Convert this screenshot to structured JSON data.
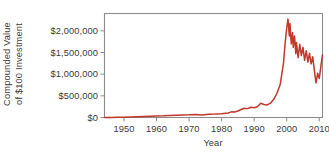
{
  "chart_data": {
    "type": "line",
    "title": "",
    "xlabel": "Year",
    "ylabel_lines": [
      "Compounded Value",
      "of $100 Investment"
    ],
    "ylabel": "Compounded Value of $100 Investment",
    "xlim": [
      1944,
      2011
    ],
    "ylim": [
      0,
      2400000
    ],
    "grid": false,
    "legend": false,
    "line_color": "#C0392B",
    "frame_color": "#8c8c8c",
    "background": "#ffffff",
    "y_ticks": [
      0,
      500000,
      1000000,
      1500000,
      2000000
    ],
    "y_tick_labels": [
      "$0",
      "$500,000",
      "$1,000,000",
      "$1,500,000",
      "$2,000,000"
    ],
    "x_ticks": [
      1950,
      1960,
      1970,
      1980,
      1990,
      2000,
      2010
    ],
    "x_tick_labels": [
      "1950",
      "1960",
      "1970",
      "1980",
      "1990",
      "2000",
      "2010"
    ],
    "series": [
      {
        "name": "Compounded value of $100 investment",
        "x": [
          1944,
          1946,
          1948,
          1950,
          1952,
          1954,
          1956,
          1958,
          1960,
          1962,
          1964,
          1966,
          1968,
          1970,
          1972,
          1974,
          1976,
          1978,
          1980,
          1982,
          1983,
          1984,
          1985,
          1986,
          1987,
          1988,
          1989,
          1990,
          1991,
          1992,
          1993,
          1994,
          1995,
          1996,
          1997,
          1998,
          1999,
          1999.5,
          2000,
          2000.4,
          2000.8,
          2001,
          2001.4,
          2001.8,
          2002,
          2002.4,
          2002.8,
          2003,
          2003.5,
          2004,
          2004.5,
          2005,
          2005.5,
          2006,
          2006.5,
          2007,
          2007.5,
          2008,
          2008.5,
          2009,
          2009.5,
          2010,
          2010.5,
          2011
        ],
        "y": [
          1200,
          2500,
          4000,
          6500,
          10000,
          15000,
          21000,
          27000,
          34000,
          38000,
          46000,
          52000,
          60000,
          62000,
          68000,
          60000,
          75000,
          78000,
          88000,
          105000,
          130000,
          128000,
          150000,
          185000,
          215000,
          205000,
          235000,
          225000,
          250000,
          330000,
          300000,
          290000,
          330000,
          420000,
          560000,
          760000,
          1250000,
          1700000,
          2060000,
          2270000,
          1880000,
          2170000,
          1700000,
          1960000,
          1620000,
          1880000,
          1470000,
          1730000,
          1380000,
          1690000,
          1430000,
          1620000,
          1320000,
          1540000,
          1280000,
          1480000,
          1240000,
          1400000,
          1080000,
          800000,
          1020000,
          900000,
          1180000,
          1450000
        ]
      }
    ],
    "annotations": []
  },
  "figure": {
    "width": 329,
    "height": 158
  }
}
